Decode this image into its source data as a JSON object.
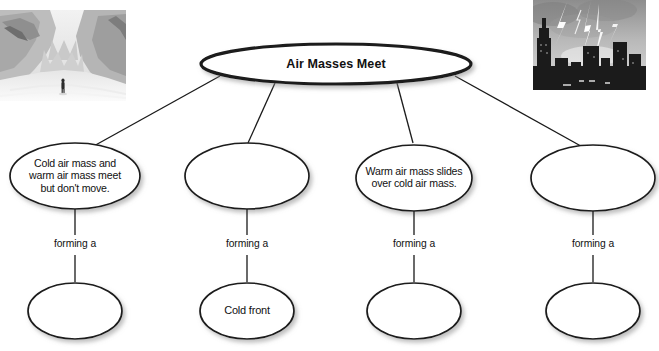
{
  "diagram": {
    "type": "concept-map",
    "root": {
      "label": "Air Masses Meet"
    },
    "branches": [
      {
        "description": "Cold air mass and\nwarm air mass meet\nbut don't move.",
        "connector_label": "forming a",
        "result": ""
      },
      {
        "description": "",
        "connector_label": "forming a",
        "result": "Cold  front"
      },
      {
        "description": "Warm air mass slides\nover cold air mass.",
        "connector_label": "forming a",
        "result": ""
      },
      {
        "description": "",
        "connector_label": "forming a",
        "result": ""
      }
    ]
  },
  "photos": [
    {
      "name": "snowy-canyon-photo",
      "caption": "Snow covered canyon with a person walking"
    },
    {
      "name": "lightning-city-photo",
      "caption": "Lightning striking over a city skyline at night"
    }
  ],
  "colors": {
    "stroke": "#1a1a1a",
    "text": "#111111",
    "background": "#ffffff"
  }
}
